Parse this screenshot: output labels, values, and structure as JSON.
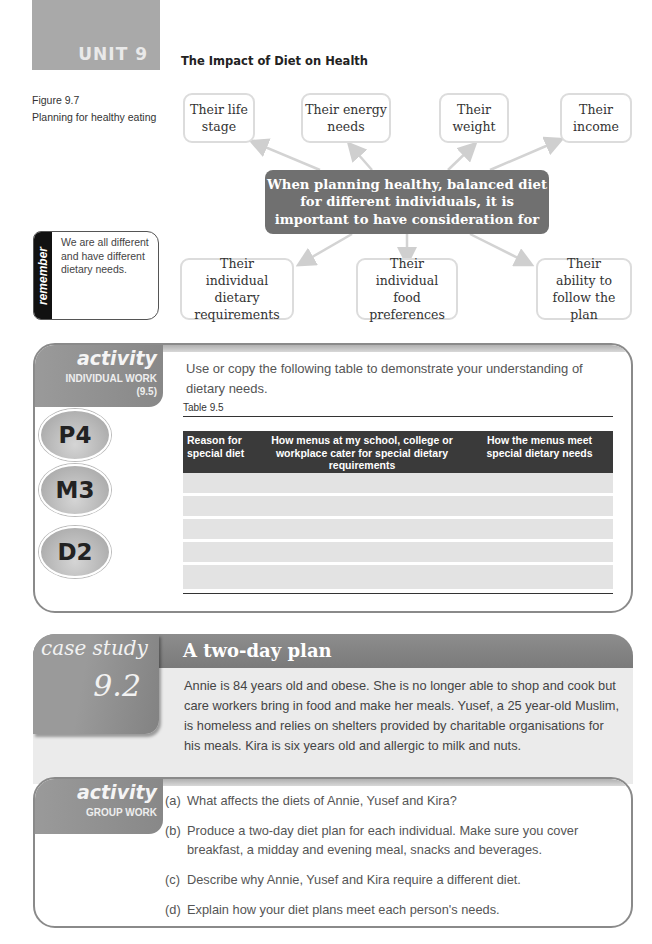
{
  "header": {
    "unit_label": "UNIT 9",
    "page_title": "The Impact of Diet on Health"
  },
  "figure": {
    "number": "Figure 9.7",
    "caption": "Planning for healthy eating",
    "center_text": "When planning healthy, balanced diet for different individuals, it is important to have consideration for",
    "top_nodes": [
      "Their life stage",
      "Their energy needs",
      "Their weight",
      "Their income"
    ],
    "bottom_nodes": [
      "Their individual dietary requirements",
      "Their individual food preferences",
      "Their ability to follow the plan"
    ]
  },
  "remember": {
    "label": "remember",
    "text": "We are all different and have different dietary needs."
  },
  "activity_individual": {
    "title": "activity",
    "subtitle": "INDIVIDUAL WORK",
    "ref": "(9.5)",
    "badges": [
      "P4",
      "M3",
      "D2"
    ],
    "intro": "Use or copy the following table to demonstrate your understanding of dietary needs.",
    "table_caption": "Table 9.5",
    "table_headers": [
      "Reason for special diet",
      "How menus at my school, college or workplace cater for special dietary requirements",
      "How the menus meet special dietary needs"
    ],
    "empty_rows": 5
  },
  "case_study": {
    "tab_title": "case study",
    "tab_number": "9.2",
    "title": "A two-day plan",
    "body": "Annie is 84 years old and obese. She is no longer able to shop and cook but care workers bring in food and make her meals. Yusef, a 25 year-old Muslim, is homeless and relies on shelters provided by charitable organisations for his meals. Kira is six years old and allergic to milk and nuts."
  },
  "activity_group": {
    "title": "activity",
    "subtitle": "GROUP WORK",
    "questions": [
      {
        "label": "(a)",
        "text": "What affects the diets of Annie, Yusef and Kira?"
      },
      {
        "label": "(b)",
        "text": "Produce a two-day diet plan for each individual. Make sure you cover breakfast, a midday and evening meal, snacks and beverages."
      },
      {
        "label": "(c)",
        "text": "Describe why Annie, Yusef and Kira require a different diet."
      },
      {
        "label": "(d)",
        "text": "Explain how your diet plans meet each person's needs."
      }
    ]
  }
}
